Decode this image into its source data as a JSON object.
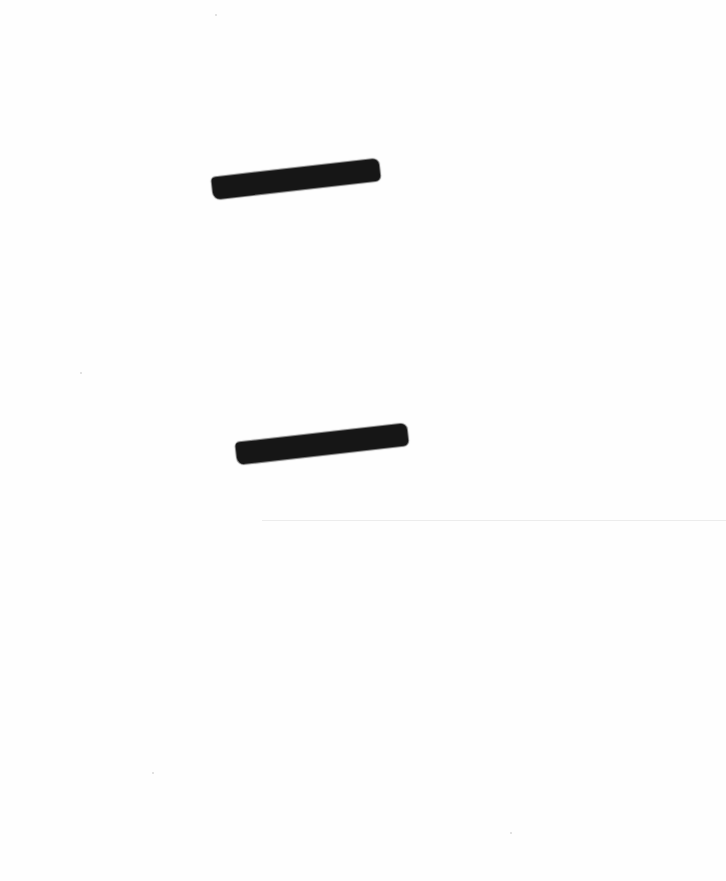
{
  "document": {
    "type": "scanned page",
    "background_color": "#fefefe",
    "redactions": [
      {
        "label": "redacted",
        "x": 212,
        "y": 168,
        "width": 168,
        "height": 22,
        "rotation_deg": -6.5,
        "color": "#161616"
      },
      {
        "label": "redacted",
        "x": 236,
        "y": 433,
        "width": 172,
        "height": 22,
        "rotation_deg": -6.5,
        "color": "#161616"
      }
    ],
    "rule": {
      "x": 262,
      "y": 520,
      "width": 464,
      "color": "#ececec"
    }
  }
}
